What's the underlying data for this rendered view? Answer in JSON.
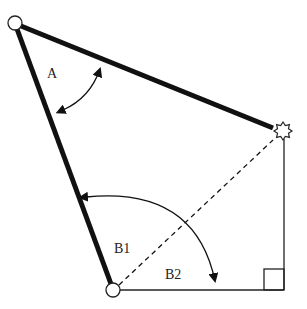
{
  "diagram": {
    "labels": {
      "angle_a": "A",
      "angle_b1": "B1",
      "angle_b2": "B2"
    },
    "colors": {
      "stroke": "#111111",
      "background": "#ffffff"
    },
    "elements": {
      "top_joint": "hinge-circle",
      "bottom_joint": "hinge-circle",
      "end_effector": "star-marker",
      "right_angle": "right-angle-square"
    }
  }
}
